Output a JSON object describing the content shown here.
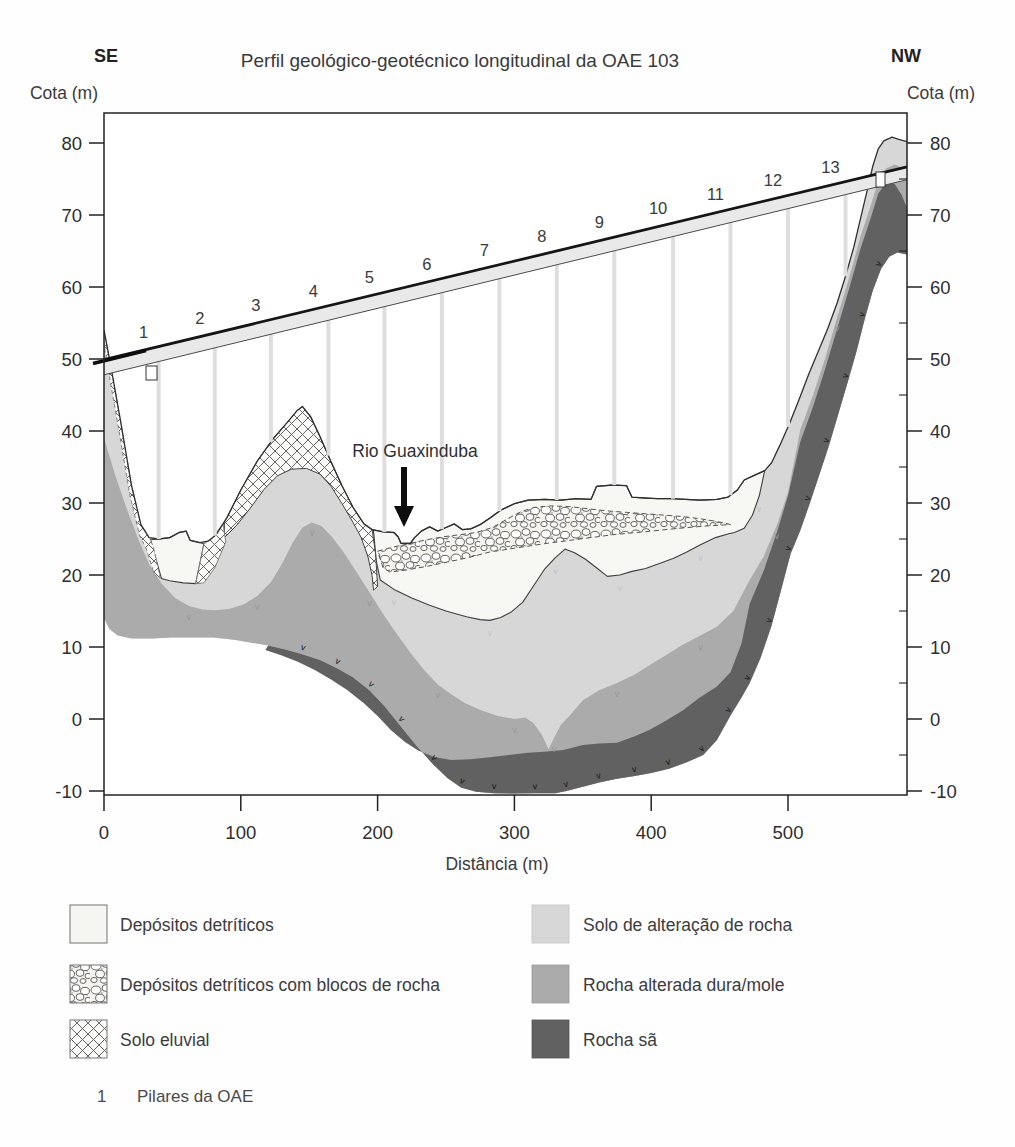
{
  "title": "Perfil geológico-geotécnico longitudinal da OAE 103",
  "orientation": {
    "left": "SE",
    "right": "NW"
  },
  "axes": {
    "elev_label_left": "Cota (m)",
    "elev_label_right": "Cota (m)",
    "dist_label": "Distância (m)",
    "elev_major_ticks": [
      80,
      70,
      60,
      50,
      40,
      30,
      20,
      10,
      0,
      -10
    ],
    "elev_minor_ticks": [
      75,
      65,
      55,
      45,
      35,
      25,
      15,
      5,
      -5
    ],
    "dist_ticks": [
      0,
      100,
      200,
      300,
      400,
      500
    ],
    "elev_range": [
      -10.5,
      84.2
    ],
    "dist_range": [
      0,
      587
    ]
  },
  "annotation": {
    "river": "Rio Guaxinduba"
  },
  "bridge": {
    "pillar_numbers": [
      1,
      2,
      3,
      4,
      5,
      6,
      7,
      8,
      9,
      10,
      11,
      12,
      13
    ],
    "pillar_x": [
      40,
      81,
      122,
      164,
      205,
      247,
      289,
      331,
      373,
      416,
      458,
      500,
      542
    ],
    "deck_elev_start": 49.9,
    "deck_elev_end": 76.7,
    "deck_bottom_start": 47.8,
    "deck_bottom_end": 74.9
  },
  "legend": {
    "items": [
      {
        "label": "Depósitos detríticos",
        "swatch": "deposit-plain"
      },
      {
        "label": "Depósitos detríticos com blocos de rocha",
        "swatch": "deposit-blocks"
      },
      {
        "label": "Solo eluvial",
        "swatch": "eluvial-crosshatch"
      },
      {
        "label": "Solo de alteração de rocha",
        "swatch": "light-gray"
      },
      {
        "label": "Rocha alterada dura/mole",
        "swatch": "medium-gray"
      },
      {
        "label": "Rocha sã",
        "swatch": "dark-gray"
      }
    ]
  },
  "footnote": {
    "symbol": "1",
    "label": "Pilares da OAE"
  },
  "colors": {
    "light": "#d7d7d7",
    "medium": "#ababab",
    "dark": "#616161",
    "deposit": "#f7f7f4",
    "deck_fill": "#e9e9e9",
    "pillar": "#dedede",
    "ink": "#2b2b2b",
    "boundary": "#3f3f3f"
  },
  "profile": {
    "surface": [
      [
        0,
        54
      ],
      [
        5,
        49
      ],
      [
        12,
        41.5
      ],
      [
        20,
        32.5
      ],
      [
        27,
        27
      ],
      [
        33,
        25.2
      ],
      [
        40,
        25
      ],
      [
        48,
        25.2
      ],
      [
        55,
        25.9
      ],
      [
        60,
        26.1
      ],
      [
        63,
        24.8
      ],
      [
        70,
        24.5
      ],
      [
        76,
        24.7
      ],
      [
        82,
        25.6
      ],
      [
        90,
        28
      ],
      [
        100,
        31.8
      ],
      [
        112,
        35.8
      ],
      [
        124,
        39
      ],
      [
        134,
        41.2
      ],
      [
        141,
        42.8
      ],
      [
        145,
        43.4
      ],
      [
        151,
        42
      ],
      [
        158,
        39.2
      ],
      [
        166,
        35.7
      ],
      [
        174,
        32.4
      ],
      [
        182,
        29.4
      ],
      [
        190,
        27.1
      ],
      [
        196,
        26.3
      ],
      [
        204,
        26
      ],
      [
        212,
        25.9
      ],
      [
        215,
        25.3
      ],
      [
        217,
        24.4
      ],
      [
        224,
        24.4
      ],
      [
        227,
        25.2
      ],
      [
        232,
        26.1
      ],
      [
        238,
        26.7
      ],
      [
        244,
        26.1
      ],
      [
        250,
        26.6
      ],
      [
        256,
        27.1
      ],
      [
        262,
        26.3
      ],
      [
        268,
        26.4
      ],
      [
        275,
        27
      ],
      [
        282,
        27.9
      ],
      [
        290,
        29
      ],
      [
        300,
        29.9
      ],
      [
        310,
        30.4
      ],
      [
        322,
        30.5
      ],
      [
        334,
        30.4
      ],
      [
        345,
        30.6
      ],
      [
        356,
        30.5
      ],
      [
        360,
        32.3
      ],
      [
        372,
        32.5
      ],
      [
        382,
        32.4
      ],
      [
        386,
        30.8
      ],
      [
        395,
        30.7
      ],
      [
        405,
        30.6
      ],
      [
        415,
        30.6
      ],
      [
        425,
        30.5
      ],
      [
        436,
        30.4
      ],
      [
        448,
        30.5
      ],
      [
        456,
        30.8
      ],
      [
        463,
        31.8
      ],
      [
        468,
        33.2
      ],
      [
        476,
        33.9
      ],
      [
        483,
        34.5
      ],
      [
        488,
        35.6
      ],
      [
        494,
        38
      ],
      [
        501,
        41
      ],
      [
        508,
        44.3
      ],
      [
        515,
        47.8
      ],
      [
        522,
        51
      ],
      [
        529,
        54.2
      ],
      [
        536,
        57.8
      ],
      [
        542,
        61.5
      ],
      [
        548,
        65.5
      ],
      [
        553,
        69.5
      ],
      [
        558,
        73.5
      ],
      [
        562,
        76.8
      ],
      [
        566,
        79.2
      ],
      [
        570,
        80.3
      ],
      [
        576,
        80.8
      ],
      [
        581,
        80.5
      ],
      [
        587,
        80.2
      ]
    ],
    "section_bottom": [
      [
        0,
        14
      ],
      [
        4,
        12.5
      ],
      [
        10,
        11.6
      ],
      [
        20,
        11.2
      ],
      [
        35,
        11.2
      ],
      [
        50,
        11.3
      ],
      [
        65,
        11.3
      ],
      [
        80,
        11.3
      ],
      [
        95,
        11
      ],
      [
        108,
        10.6
      ],
      [
        120,
        10.2
      ],
      [
        132,
        9.7
      ],
      [
        145,
        9
      ],
      [
        158,
        8.2
      ],
      [
        170,
        7.1
      ],
      [
        182,
        5.8
      ],
      [
        194,
        4
      ],
      [
        205,
        1.8
      ],
      [
        216,
        -0.8
      ],
      [
        228,
        -3.6
      ],
      [
        240,
        -6.2
      ],
      [
        251,
        -8.2
      ],
      [
        261,
        -9.5
      ],
      [
        272,
        -10.1
      ],
      [
        285,
        -10.3
      ],
      [
        300,
        -10.35
      ],
      [
        315,
        -10.3
      ],
      [
        330,
        -10.3
      ],
      [
        338,
        -10
      ],
      [
        350,
        -9.4
      ],
      [
        362,
        -8.8
      ],
      [
        375,
        -8.3
      ],
      [
        388,
        -7.9
      ],
      [
        400,
        -7.5
      ],
      [
        413,
        -6.9
      ],
      [
        426,
        -6
      ],
      [
        438,
        -5
      ],
      [
        448,
        -2.9
      ],
      [
        458,
        0.5
      ],
      [
        466,
        3
      ],
      [
        472,
        5
      ],
      [
        480,
        8.5
      ],
      [
        488,
        13
      ],
      [
        495,
        18
      ],
      [
        502,
        23
      ],
      [
        509,
        26.2
      ],
      [
        516,
        30
      ],
      [
        523,
        34
      ],
      [
        530,
        38
      ],
      [
        537,
        42.5
      ],
      [
        544,
        47
      ],
      [
        550,
        51
      ],
      [
        556,
        55.5
      ],
      [
        562,
        59.5
      ],
      [
        568,
        62.5
      ],
      [
        574,
        64.2
      ],
      [
        580,
        64.8
      ],
      [
        587,
        64.5
      ]
    ],
    "medium_top": [
      [
        0,
        39
      ],
      [
        8,
        34
      ],
      [
        16,
        29.5
      ],
      [
        25,
        25
      ],
      [
        33,
        21.5
      ],
      [
        42,
        18.8
      ],
      [
        52,
        16.8
      ],
      [
        62,
        15.7
      ],
      [
        72,
        15.2
      ],
      [
        82,
        15.1
      ],
      [
        92,
        15.3
      ],
      [
        102,
        15.9
      ],
      [
        112,
        17.1
      ],
      [
        122,
        19
      ],
      [
        130,
        21.5
      ],
      [
        138,
        24.5
      ],
      [
        145,
        26.6
      ],
      [
        152,
        27.3
      ],
      [
        159,
        26.8
      ],
      [
        167,
        25.2
      ],
      [
        175,
        23.2
      ],
      [
        184,
        20.6
      ],
      [
        194,
        17.6
      ],
      [
        204,
        14.6
      ],
      [
        214,
        11.8
      ],
      [
        224,
        9.2
      ],
      [
        234,
        6.8
      ],
      [
        244,
        4.8
      ],
      [
        254,
        3.4
      ],
      [
        264,
        2.2
      ],
      [
        276,
        1.2
      ],
      [
        288,
        0.4
      ],
      [
        300,
        0
      ],
      [
        308,
        0.2
      ],
      [
        314,
        -0.6
      ],
      [
        320,
        -2.2
      ],
      [
        325,
        -4.2
      ],
      [
        329,
        -2.6
      ],
      [
        334,
        -0.8
      ],
      [
        341,
        0.6
      ],
      [
        350,
        2.6
      ],
      [
        362,
        4
      ],
      [
        375,
        5
      ],
      [
        388,
        6.2
      ],
      [
        399,
        7.5
      ],
      [
        411,
        8.9
      ],
      [
        423,
        10.3
      ],
      [
        436,
        11.6
      ],
      [
        448,
        12.8
      ],
      [
        460,
        15
      ],
      [
        472,
        19.3
      ],
      [
        482,
        22.5
      ],
      [
        492,
        27
      ],
      [
        500,
        31.5
      ],
      [
        509,
        40.2
      ],
      [
        518,
        44.8
      ],
      [
        527,
        50
      ],
      [
        536,
        55.8
      ],
      [
        545,
        61.5
      ],
      [
        553,
        67
      ],
      [
        560,
        71
      ],
      [
        566,
        74.8
      ],
      [
        572,
        76.5
      ],
      [
        578,
        77
      ],
      [
        583,
        76.6
      ],
      [
        587,
        75.5
      ]
    ],
    "dark_top": [
      [
        118,
        9.6
      ],
      [
        130,
        8.8
      ],
      [
        142,
        7.9
      ],
      [
        154,
        6.8
      ],
      [
        166,
        5.5
      ],
      [
        178,
        4
      ],
      [
        190,
        2.2
      ],
      [
        200,
        0.4
      ],
      [
        210,
        -1.6
      ],
      [
        220,
        -3.2
      ],
      [
        230,
        -4.4
      ],
      [
        242,
        -5.3
      ],
      [
        254,
        -5.7
      ],
      [
        268,
        -5.6
      ],
      [
        282,
        -5.3
      ],
      [
        296,
        -5
      ],
      [
        310,
        -4.7
      ],
      [
        324,
        -4.5
      ],
      [
        336,
        -4.3
      ],
      [
        350,
        -3.6
      ],
      [
        362,
        -3.4
      ],
      [
        375,
        -3.3
      ],
      [
        388,
        -2.4
      ],
      [
        399,
        -1.5
      ],
      [
        410,
        -0.3
      ],
      [
        423,
        1.2
      ],
      [
        435,
        2.9
      ],
      [
        448,
        4.5
      ],
      [
        458,
        6.5
      ],
      [
        466,
        10.5
      ],
      [
        472,
        16
      ],
      [
        482,
        20.5
      ],
      [
        492,
        26
      ],
      [
        500,
        31
      ],
      [
        509,
        38.5
      ],
      [
        518,
        43.2
      ],
      [
        527,
        48.5
      ],
      [
        536,
        54.2
      ],
      [
        545,
        60
      ],
      [
        553,
        65.3
      ],
      [
        560,
        69.3
      ],
      [
        566,
        73
      ],
      [
        572,
        74.6
      ],
      [
        578,
        74.3
      ],
      [
        583,
        72.8
      ],
      [
        587,
        71
      ]
    ],
    "white_basin_bottom": [
      [
        197,
        26.2
      ],
      [
        199,
        22
      ],
      [
        202,
        19.3
      ],
      [
        212,
        18
      ],
      [
        225,
        16.8
      ],
      [
        238,
        15.8
      ],
      [
        250,
        15
      ],
      [
        265,
        14.2
      ],
      [
        275,
        13.8
      ],
      [
        282,
        13.7
      ],
      [
        290,
        14.1
      ],
      [
        298,
        14.9
      ],
      [
        306,
        16.2
      ],
      [
        314,
        18.5
      ],
      [
        322,
        20.8
      ],
      [
        330,
        22.4
      ],
      [
        337,
        23.6
      ],
      [
        344,
        23.1
      ],
      [
        352,
        22.2
      ],
      [
        360,
        21
      ],
      [
        368,
        19.8
      ],
      [
        377,
        20
      ],
      [
        386,
        20.5
      ],
      [
        396,
        20.9
      ],
      [
        406,
        21.6
      ],
      [
        416,
        22.3
      ],
      [
        426,
        23.2
      ],
      [
        436,
        24.2
      ],
      [
        447,
        25.2
      ],
      [
        456,
        25.7
      ],
      [
        461,
        25.9
      ],
      [
        468,
        26.5
      ],
      [
        474,
        28.3
      ],
      [
        479,
        31
      ],
      [
        483,
        34.5
      ]
    ],
    "pocket": [
      [
        34,
        24.9
      ],
      [
        40,
        25
      ],
      [
        48,
        25.2
      ],
      [
        55,
        25.9
      ],
      [
        60,
        26.1
      ],
      [
        63,
        24.8
      ],
      [
        70,
        24.5
      ],
      [
        73,
        24.3
      ],
      [
        67,
        18.8
      ],
      [
        58,
        18.9
      ],
      [
        48,
        19.2
      ],
      [
        42,
        19.5
      ]
    ],
    "lens_top": [
      [
        200,
        23.3
      ],
      [
        212,
        23.9
      ],
      [
        224,
        24.4
      ],
      [
        236,
        24.9
      ],
      [
        248,
        25.3
      ],
      [
        260,
        25.6
      ],
      [
        272,
        25.9
      ],
      [
        284,
        26.6
      ],
      [
        295,
        27.8
      ],
      [
        305,
        28.8
      ],
      [
        315,
        29.4
      ],
      [
        327,
        29.6
      ],
      [
        340,
        29.5
      ],
      [
        354,
        29.2
      ],
      [
        368,
        28.9
      ],
      [
        382,
        28.7
      ],
      [
        396,
        28.5
      ],
      [
        410,
        28.3
      ],
      [
        424,
        28.1
      ],
      [
        436,
        27.8
      ],
      [
        446,
        27.5
      ],
      [
        454,
        27.2
      ],
      [
        458,
        27
      ]
    ],
    "lens_bottom": [
      [
        458,
        27
      ],
      [
        440,
        26.8
      ],
      [
        421,
        26.5
      ],
      [
        400,
        26.1
      ],
      [
        372,
        25.6
      ],
      [
        348,
        25
      ],
      [
        324,
        24.4
      ],
      [
        303,
        23.8
      ],
      [
        282,
        23.2
      ],
      [
        266,
        22.4
      ],
      [
        251,
        21.8
      ],
      [
        236,
        21.2
      ],
      [
        221,
        20.7
      ],
      [
        209,
        20.4
      ],
      [
        204,
        21
      ],
      [
        200,
        23.3
      ]
    ],
    "hill_cap_outer": [
      [
        88,
        27.3
      ],
      [
        100,
        31.8
      ],
      [
        112,
        35.8
      ],
      [
        124,
        39
      ],
      [
        134,
        41.2
      ],
      [
        141,
        42.8
      ],
      [
        145,
        43.4
      ],
      [
        151,
        42
      ],
      [
        158,
        39.2
      ],
      [
        166,
        35.7
      ],
      [
        174,
        32.4
      ],
      [
        182,
        29.4
      ],
      [
        190,
        27.1
      ],
      [
        196,
        26.3
      ],
      [
        198.5,
        23
      ],
      [
        199.5,
        20
      ],
      [
        200,
        18.4
      ]
    ],
    "hill_cap_inner": [
      [
        197,
        17.9
      ],
      [
        196,
        19.9
      ],
      [
        193,
        22.5
      ],
      [
        188,
        25.2
      ],
      [
        182,
        27.3
      ],
      [
        174,
        29.9
      ],
      [
        166,
        32.3
      ],
      [
        158,
        34
      ],
      [
        148,
        34.8
      ],
      [
        137,
        34.7
      ],
      [
        127,
        33.8
      ],
      [
        117,
        31.9
      ],
      [
        107,
        29.3
      ],
      [
        97,
        26.9
      ],
      [
        88,
        25.2
      ]
    ],
    "slope_strip": [
      [
        0,
        54
      ],
      [
        5,
        49
      ],
      [
        12,
        41.5
      ],
      [
        20,
        32.5
      ],
      [
        27,
        27
      ],
      [
        33,
        25.2
      ],
      [
        36,
        24
      ],
      [
        41,
        19.6
      ],
      [
        37,
        20
      ],
      [
        31,
        23.6
      ],
      [
        26,
        25.5
      ],
      [
        19,
        31
      ],
      [
        11,
        40
      ],
      [
        4,
        47.5
      ],
      [
        0,
        52
      ]
    ],
    "sliver": [
      [
        67,
        18.8
      ],
      [
        73,
        24.3
      ],
      [
        79,
        25.1
      ],
      [
        87,
        27.1
      ],
      [
        89,
        24.6
      ],
      [
        81,
        21
      ],
      [
        73,
        18.9
      ]
    ]
  }
}
